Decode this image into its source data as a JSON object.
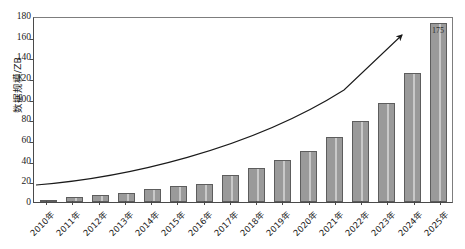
{
  "chart_data": {
    "type": "bar",
    "title": "",
    "xlabel": "",
    "ylabel": "数据规模/ZB",
    "ylim": [
      0,
      180
    ],
    "ytick_values": [
      0,
      20,
      40,
      60,
      80,
      100,
      120,
      140,
      160,
      180
    ],
    "grid": false,
    "legend": "none",
    "categories": [
      "2010年",
      "2011年",
      "2012年",
      "2013年",
      "2014年",
      "2015年",
      "2016年",
      "2017年",
      "2018年",
      "2019年",
      "2020年",
      "2021年",
      "2022年",
      "2023年",
      "2024年",
      "2025年"
    ],
    "values": [
      2,
      5,
      7,
      9,
      13,
      16,
      18,
      26,
      33,
      41,
      50,
      64,
      79,
      97,
      126,
      175
    ],
    "data_labels": [
      "",
      "",
      "",
      "",
      "",
      "",
      "",
      "",
      "",
      "",
      "",
      "",
      "",
      "",
      "",
      "175"
    ],
    "annotations": [
      {
        "name": "exponential-trend-arrow",
        "description": "curved arrow rising from left to upper right"
      }
    ]
  }
}
